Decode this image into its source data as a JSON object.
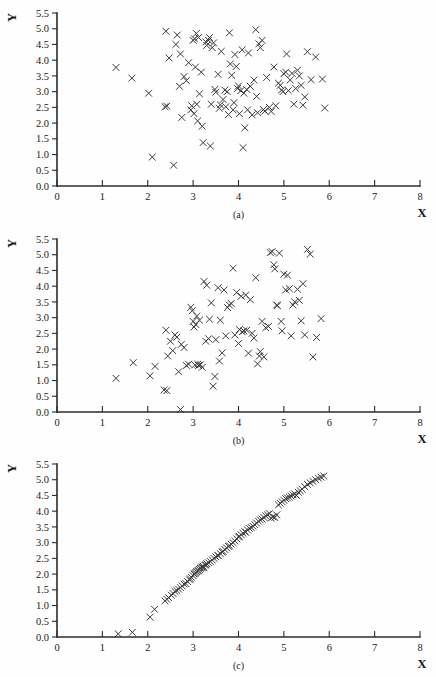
{
  "figure": {
    "title": "",
    "background_color": "#ffffff",
    "marker_color": "#3a3a3a",
    "axis_color": "#2b2b2b",
    "marker_symbol": "x"
  },
  "axis_labels": {
    "x": "X",
    "y": "Y"
  },
  "captions": {
    "a": "(a)",
    "b": "(b)",
    "c": "(c)"
  },
  "x_ticks": [
    "0",
    "1",
    "2",
    "3",
    "4",
    "5",
    "6",
    "7",
    "8"
  ],
  "y_ticks": [
    "0.0",
    "0.5",
    "1.0",
    "1.5",
    "2.0",
    "2.5",
    "3.0",
    "3.5",
    "4.0",
    "4.5",
    "5.0",
    "5.5"
  ],
  "chart_data": [
    {
      "type": "scatter",
      "id": "a",
      "title": "(a)",
      "xlabel": "X",
      "ylabel": "Y",
      "xlim": [
        0,
        8
      ],
      "ylim": [
        0.0,
        5.5
      ],
      "xticks": [
        0,
        1,
        2,
        3,
        4,
        5,
        6,
        7,
        8
      ],
      "yticks": [
        0.0,
        0.5,
        1.0,
        1.5,
        2.0,
        2.5,
        3.0,
        3.5,
        4.0,
        4.5,
        5.0,
        5.5
      ],
      "grid": false,
      "legend": "none",
      "marker": "x",
      "correlation_描述": "",
      "points": [
        [
          1.3,
          3.77
        ],
        [
          1.65,
          3.43
        ],
        [
          2.02,
          2.95
        ],
        [
          2.1,
          0.92
        ],
        [
          2.38,
          2.52
        ],
        [
          2.4,
          4.92
        ],
        [
          2.42,
          2.54
        ],
        [
          2.47,
          4.07
        ],
        [
          2.57,
          0.66
        ],
        [
          2.62,
          4.5
        ],
        [
          2.65,
          4.8
        ],
        [
          2.7,
          3.17
        ],
        [
          2.72,
          4.2
        ],
        [
          2.75,
          2.18
        ],
        [
          2.8,
          3.48
        ],
        [
          2.85,
          3.35
        ],
        [
          2.9,
          3.92
        ],
        [
          2.95,
          2.42
        ],
        [
          2.97,
          2.55
        ],
        [
          3.0,
          4.63
        ],
        [
          3.02,
          2.3
        ],
        [
          3.03,
          4.68
        ],
        [
          3.05,
          3.78
        ],
        [
          3.07,
          4.85
        ],
        [
          3.08,
          2.6
        ],
        [
          3.1,
          2.07
        ],
        [
          3.12,
          4.72
        ],
        [
          3.14,
          2.93
        ],
        [
          3.18,
          3.62
        ],
        [
          3.2,
          1.9
        ],
        [
          3.22,
          1.38
        ],
        [
          3.28,
          4.58
        ],
        [
          3.3,
          4.47
        ],
        [
          3.34,
          4.63
        ],
        [
          3.36,
          4.72
        ],
        [
          3.38,
          1.27
        ],
        [
          3.4,
          2.6
        ],
        [
          3.42,
          4.4
        ],
        [
          3.45,
          4.55
        ],
        [
          3.48,
          3.07
        ],
        [
          3.5,
          2.98
        ],
        [
          3.55,
          3.55
        ],
        [
          3.58,
          2.47
        ],
        [
          3.6,
          2.58
        ],
        [
          3.62,
          4.28
        ],
        [
          3.66,
          2.75
        ],
        [
          3.7,
          3.05
        ],
        [
          3.72,
          2.52
        ],
        [
          3.75,
          3.0
        ],
        [
          3.78,
          2.27
        ],
        [
          3.8,
          4.87
        ],
        [
          3.82,
          3.88
        ],
        [
          3.85,
          3.52
        ],
        [
          3.88,
          2.42
        ],
        [
          3.9,
          2.65
        ],
        [
          3.92,
          4.18
        ],
        [
          3.95,
          3.8
        ],
        [
          3.98,
          3.1
        ],
        [
          4.0,
          3.18
        ],
        [
          4.02,
          2.3
        ],
        [
          4.05,
          3.03
        ],
        [
          4.08,
          4.33
        ],
        [
          4.1,
          1.22
        ],
        [
          4.12,
          2.95
        ],
        [
          4.14,
          1.85
        ],
        [
          4.18,
          3.07
        ],
        [
          4.2,
          2.42
        ],
        [
          4.22,
          4.23
        ],
        [
          4.26,
          3.17
        ],
        [
          4.3,
          2.26
        ],
        [
          4.34,
          3.37
        ],
        [
          4.38,
          4.97
        ],
        [
          4.4,
          2.85
        ],
        [
          4.42,
          2.33
        ],
        [
          4.45,
          4.52
        ],
        [
          4.48,
          4.4
        ],
        [
          4.52,
          4.63
        ],
        [
          4.55,
          2.43
        ],
        [
          4.58,
          2.38
        ],
        [
          4.62,
          3.45
        ],
        [
          4.68,
          2.5
        ],
        [
          4.72,
          2.37
        ],
        [
          4.78,
          3.78
        ],
        [
          4.82,
          2.55
        ],
        [
          4.88,
          3.27
        ],
        [
          4.92,
          3.2
        ],
        [
          4.95,
          3.05
        ],
        [
          4.98,
          3.0
        ],
        [
          5.0,
          3.57
        ],
        [
          5.04,
          3.62
        ],
        [
          5.06,
          4.2
        ],
        [
          5.1,
          3.03
        ],
        [
          5.14,
          3.37
        ],
        [
          5.18,
          3.58
        ],
        [
          5.22,
          2.6
        ],
        [
          5.26,
          3.1
        ],
        [
          5.3,
          3.68
        ],
        [
          5.34,
          3.5
        ],
        [
          5.38,
          3.2
        ],
        [
          5.42,
          2.57
        ],
        [
          5.46,
          2.83
        ],
        [
          5.52,
          4.27
        ],
        [
          5.6,
          3.38
        ],
        [
          5.7,
          4.1
        ],
        [
          5.85,
          3.4
        ],
        [
          5.9,
          2.48
        ]
      ]
    },
    {
      "type": "scatter",
      "id": "b",
      "title": "(b)",
      "xlabel": "X",
      "ylabel": "Y",
      "xlim": [
        0,
        8
      ],
      "ylim": [
        0.0,
        5.5
      ],
      "xticks": [
        0,
        1,
        2,
        3,
        4,
        5,
        6,
        7,
        8
      ],
      "yticks": [
        0.0,
        0.5,
        1.0,
        1.5,
        2.0,
        2.5,
        3.0,
        3.5,
        4.0,
        4.5,
        5.0,
        5.5
      ],
      "grid": false,
      "legend": "none",
      "marker": "x",
      "points": [
        [
          1.3,
          1.07
        ],
        [
          1.68,
          1.57
        ],
        [
          2.05,
          1.15
        ],
        [
          2.16,
          1.45
        ],
        [
          2.36,
          0.7
        ],
        [
          2.42,
          0.68
        ],
        [
          2.4,
          2.6
        ],
        [
          2.44,
          1.78
        ],
        [
          2.5,
          2.25
        ],
        [
          2.55,
          1.95
        ],
        [
          2.6,
          2.45
        ],
        [
          2.64,
          2.38
        ],
        [
          2.68,
          1.28
        ],
        [
          2.72,
          0.08
        ],
        [
          2.74,
          2.15
        ],
        [
          2.8,
          2.05
        ],
        [
          2.85,
          1.48
        ],
        [
          2.9,
          1.52
        ],
        [
          2.95,
          3.33
        ],
        [
          2.98,
          3.22
        ],
        [
          3.0,
          2.88
        ],
        [
          3.02,
          2.7
        ],
        [
          3.04,
          1.5
        ],
        [
          3.06,
          2.78
        ],
        [
          3.08,
          3.05
        ],
        [
          3.1,
          1.52
        ],
        [
          3.12,
          1.48
        ],
        [
          3.14,
          2.92
        ],
        [
          3.16,
          1.5
        ],
        [
          3.2,
          1.42
        ],
        [
          3.24,
          4.15
        ],
        [
          3.28,
          2.25
        ],
        [
          3.3,
          4.03
        ],
        [
          3.34,
          2.33
        ],
        [
          3.36,
          2.95
        ],
        [
          3.4,
          3.47
        ],
        [
          3.44,
          0.82
        ],
        [
          3.48,
          1.13
        ],
        [
          3.5,
          2.3
        ],
        [
          3.55,
          3.95
        ],
        [
          3.58,
          1.62
        ],
        [
          3.6,
          2.92
        ],
        [
          3.64,
          1.88
        ],
        [
          3.68,
          3.88
        ],
        [
          3.72,
          2.42
        ],
        [
          3.76,
          3.32
        ],
        [
          3.8,
          3.4
        ],
        [
          3.84,
          3.45
        ],
        [
          3.88,
          4.57
        ],
        [
          3.92,
          2.45
        ],
        [
          3.96,
          3.8
        ],
        [
          4.0,
          2.18
        ],
        [
          4.02,
          2.62
        ],
        [
          4.06,
          3.68
        ],
        [
          4.08,
          2.55
        ],
        [
          4.12,
          2.58
        ],
        [
          4.16,
          3.72
        ],
        [
          4.18,
          2.6
        ],
        [
          4.22,
          1.87
        ],
        [
          4.26,
          3.57
        ],
        [
          4.3,
          2.5
        ],
        [
          4.34,
          2.35
        ],
        [
          4.38,
          4.27
        ],
        [
          4.42,
          1.53
        ],
        [
          4.46,
          1.78
        ],
        [
          4.48,
          1.92
        ],
        [
          4.52,
          2.88
        ],
        [
          4.56,
          1.75
        ],
        [
          4.6,
          2.68
        ],
        [
          4.66,
          2.72
        ],
        [
          4.7,
          5.07
        ],
        [
          4.74,
          5.1
        ],
        [
          4.78,
          4.68
        ],
        [
          4.8,
          4.55
        ],
        [
          4.84,
          3.4
        ],
        [
          4.86,
          3.38
        ],
        [
          4.9,
          5.05
        ],
        [
          4.94,
          2.88
        ],
        [
          4.96,
          2.58
        ],
        [
          5.0,
          4.38
        ],
        [
          5.04,
          3.88
        ],
        [
          5.08,
          4.35
        ],
        [
          5.12,
          3.92
        ],
        [
          5.16,
          2.42
        ],
        [
          5.2,
          3.4
        ],
        [
          5.24,
          3.5
        ],
        [
          5.3,
          3.9
        ],
        [
          5.34,
          3.55
        ],
        [
          5.38,
          2.9
        ],
        [
          5.42,
          4.08
        ],
        [
          5.46,
          2.45
        ],
        [
          5.52,
          5.17
        ],
        [
          5.58,
          5.02
        ],
        [
          5.64,
          1.75
        ],
        [
          5.72,
          2.37
        ],
        [
          5.82,
          2.97
        ]
      ]
    },
    {
      "type": "scatter",
      "id": "c",
      "title": "(c)",
      "xlabel": "X",
      "ylabel": "Y",
      "xlim": [
        0,
        8
      ],
      "ylim": [
        0.0,
        5.5
      ],
      "xticks": [
        0,
        1,
        2,
        3,
        4,
        5,
        6,
        7,
        8
      ],
      "yticks": [
        0.0,
        0.5,
        1.0,
        1.5,
        2.0,
        2.5,
        3.0,
        3.5,
        4.0,
        4.5,
        5.0,
        5.5
      ],
      "grid": false,
      "legend": "none",
      "marker": "x",
      "points": [
        [
          1.35,
          0.1
        ],
        [
          1.66,
          0.15
        ],
        [
          2.05,
          0.63
        ],
        [
          2.15,
          0.88
        ],
        [
          2.38,
          1.15
        ],
        [
          2.42,
          1.2
        ],
        [
          2.46,
          1.25
        ],
        [
          2.52,
          1.33
        ],
        [
          2.56,
          1.38
        ],
        [
          2.6,
          1.45
        ],
        [
          2.64,
          1.48
        ],
        [
          2.68,
          1.52
        ],
        [
          2.72,
          1.57
        ],
        [
          2.76,
          1.62
        ],
        [
          2.8,
          1.68
        ],
        [
          2.84,
          1.7
        ],
        [
          2.88,
          1.76
        ],
        [
          2.92,
          1.82
        ],
        [
          2.94,
          1.85
        ],
        [
          2.96,
          1.9
        ],
        [
          3.0,
          1.95
        ],
        [
          3.02,
          2.0
        ],
        [
          3.04,
          2.02
        ],
        [
          3.06,
          2.05
        ],
        [
          3.08,
          2.08
        ],
        [
          3.1,
          2.1
        ],
        [
          3.12,
          2.12
        ],
        [
          3.14,
          2.15
        ],
        [
          3.16,
          2.18
        ],
        [
          3.18,
          2.2
        ],
        [
          3.2,
          2.22
        ],
        [
          3.22,
          2.25
        ],
        [
          3.24,
          2.2
        ],
        [
          3.26,
          2.28
        ],
        [
          3.28,
          2.3
        ],
        [
          3.3,
          2.33
        ],
        [
          3.34,
          2.36
        ],
        [
          3.38,
          2.4
        ],
        [
          3.42,
          2.45
        ],
        [
          3.46,
          2.5
        ],
        [
          3.5,
          2.55
        ],
        [
          3.54,
          2.6
        ],
        [
          3.56,
          2.58
        ],
        [
          3.6,
          2.65
        ],
        [
          3.64,
          2.7
        ],
        [
          3.66,
          2.72
        ],
        [
          3.7,
          2.78
        ],
        [
          3.74,
          2.83
        ],
        [
          3.78,
          2.88
        ],
        [
          3.8,
          2.9
        ],
        [
          3.84,
          2.95
        ],
        [
          3.88,
          3.0
        ],
        [
          3.92,
          3.05
        ],
        [
          3.96,
          3.12
        ],
        [
          4.0,
          3.18
        ],
        [
          4.02,
          3.2
        ],
        [
          4.06,
          3.25
        ],
        [
          4.1,
          3.3
        ],
        [
          4.14,
          3.35
        ],
        [
          4.16,
          3.33
        ],
        [
          4.2,
          3.4
        ],
        [
          4.24,
          3.45
        ],
        [
          4.28,
          3.48
        ],
        [
          4.32,
          3.52
        ],
        [
          4.36,
          3.57
        ],
        [
          4.4,
          3.62
        ],
        [
          4.44,
          3.68
        ],
        [
          4.48,
          3.72
        ],
        [
          4.52,
          3.75
        ],
        [
          4.56,
          3.8
        ],
        [
          4.6,
          3.85
        ],
        [
          4.64,
          3.88
        ],
        [
          4.68,
          3.92
        ],
        [
          4.72,
          3.78
        ],
        [
          4.76,
          3.82
        ],
        [
          4.8,
          3.8
        ],
        [
          4.84,
          3.88
        ],
        [
          4.88,
          4.2
        ],
        [
          4.92,
          4.25
        ],
        [
          4.96,
          4.3
        ],
        [
          5.0,
          4.35
        ],
        [
          5.04,
          4.4
        ],
        [
          5.08,
          4.42
        ],
        [
          5.12,
          4.45
        ],
        [
          5.16,
          4.48
        ],
        [
          5.2,
          4.52
        ],
        [
          5.24,
          4.55
        ],
        [
          5.28,
          4.5
        ],
        [
          5.32,
          4.6
        ],
        [
          5.36,
          4.65
        ],
        [
          5.4,
          4.7
        ],
        [
          5.46,
          4.78
        ],
        [
          5.52,
          4.85
        ],
        [
          5.58,
          4.9
        ],
        [
          5.64,
          4.95
        ],
        [
          5.7,
          5.0
        ],
        [
          5.76,
          5.05
        ],
        [
          5.82,
          5.08
        ],
        [
          5.88,
          5.12
        ]
      ]
    }
  ]
}
